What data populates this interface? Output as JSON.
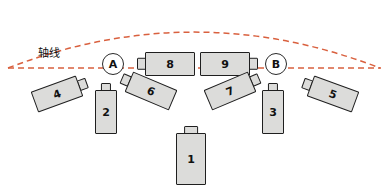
{
  "diagram": {
    "title": "",
    "canvas": {
      "width": 389,
      "height": 193,
      "background": "#ffffff"
    },
    "colors": {
      "arc": "#d9603e",
      "axis_dash": "#d9603e",
      "device_fill": "#dcdcda",
      "device_stroke": "#1f1f1f",
      "node_stroke": "#2a2a2a",
      "text": "#111111"
    },
    "axis": {
      "label": "轴线",
      "label_x": 38,
      "label_y": 44,
      "line_y": 68,
      "line_start_x": 8,
      "line_end_x": 381,
      "style": "dashed"
    },
    "arc": {
      "start_x": 8,
      "start_y": 68,
      "apex_y": 16,
      "end_x": 380,
      "end_y": 68,
      "style": "dashed"
    },
    "nodes": [
      {
        "id": "A",
        "label": "A",
        "x": 102,
        "y": 53
      },
      {
        "id": "B",
        "label": "B",
        "x": 265,
        "y": 53
      }
    ],
    "devices": [
      {
        "id": "d8",
        "label": "8",
        "x": 145,
        "y": 52,
        "w": 50,
        "h": 24,
        "rot": 0,
        "tab": "left"
      },
      {
        "id": "d9",
        "label": "9",
        "x": 200,
        "y": 52,
        "w": 50,
        "h": 24,
        "rot": 0,
        "tab": "right"
      },
      {
        "id": "d4",
        "label": "4",
        "x": 33,
        "y": 83,
        "w": 48,
        "h": 22,
        "rot": -20,
        "tab": "right"
      },
      {
        "id": "d2",
        "label": "2",
        "x": 95,
        "y": 90,
        "w": 22,
        "h": 44,
        "rot": 0,
        "tab": "top"
      },
      {
        "id": "d6",
        "label": "6",
        "x": 127,
        "y": 80,
        "w": 48,
        "h": 22,
        "rot": 23,
        "tab": "left"
      },
      {
        "id": "d7",
        "label": "7",
        "x": 206,
        "y": 80,
        "w": 48,
        "h": 22,
        "rot": -23,
        "tab": "right"
      },
      {
        "id": "d3",
        "label": "3",
        "x": 262,
        "y": 90,
        "w": 22,
        "h": 44,
        "rot": 0,
        "tab": "top"
      },
      {
        "id": "d5",
        "label": "5",
        "x": 309,
        "y": 83,
        "w": 48,
        "h": 22,
        "rot": 20,
        "tab": "left"
      },
      {
        "id": "d1",
        "label": "1",
        "x": 176,
        "y": 133,
        "w": 30,
        "h": 52,
        "rot": 0,
        "tab": "top"
      }
    ]
  }
}
